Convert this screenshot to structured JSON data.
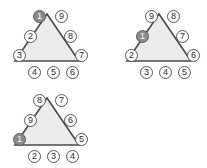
{
  "figure": {
    "background_color": "#ffffff",
    "triangle_fill_color": "#ececec",
    "triangle_stroke_color": "#4a4a4a",
    "node_fill_color": "#ffffff",
    "node_stroke_color": "#555555",
    "highlight_fill_color": "#8c8c8c",
    "highlight_text_color": "#ffffff",
    "node_count_per_triangle": 9,
    "triangle_count": 3
  },
  "chart_data": {
    "type": "diagram",
    "xlabel": "",
    "ylabel": "",
    "legend": [],
    "grid": false,
    "triangles": [
      {
        "id": "triangle-1",
        "position": "top-left",
        "highlighted_label": "1",
        "highlighted_slot": "apex-left",
        "labels_clockwise_from_apex_left": [
          "1",
          "9",
          "8",
          "7",
          "6",
          "5",
          "4",
          "3",
          "2"
        ],
        "nodes": [
          {
            "slot": "apex-left",
            "label": "1",
            "filled": true,
            "x": 33,
            "y": 10
          },
          {
            "slot": "apex-right",
            "label": "9",
            "filled": false,
            "x": 55,
            "y": 10
          },
          {
            "slot": "left-upper",
            "label": "2",
            "filled": false,
            "x": 24,
            "y": 30
          },
          {
            "slot": "right-upper",
            "label": "8",
            "filled": false,
            "x": 64,
            "y": 30
          },
          {
            "slot": "left-lower",
            "label": "3",
            "filled": false,
            "x": 13,
            "y": 49
          },
          {
            "slot": "right-lower",
            "label": "7",
            "filled": false,
            "x": 75,
            "y": 49
          },
          {
            "slot": "bottom-left",
            "label": "4",
            "filled": false,
            "x": 28,
            "y": 66
          },
          {
            "slot": "bottom-center",
            "label": "5",
            "filled": false,
            "x": 47,
            "y": 66
          },
          {
            "slot": "bottom-right",
            "label": "6",
            "filled": false,
            "x": 66,
            "y": 66
          }
        ]
      },
      {
        "id": "triangle-2",
        "position": "top-right",
        "highlighted_label": "1",
        "highlighted_slot": "left-upper",
        "labels_clockwise_from_apex_left": [
          "9",
          "8",
          "7",
          "6",
          "5",
          "4",
          "3",
          "2",
          "1"
        ],
        "nodes": [
          {
            "slot": "apex-left",
            "label": "9",
            "filled": false,
            "x": 33,
            "y": 10
          },
          {
            "slot": "apex-right",
            "label": "8",
            "filled": false,
            "x": 55,
            "y": 10
          },
          {
            "slot": "left-upper",
            "label": "1",
            "filled": true,
            "x": 24,
            "y": 30
          },
          {
            "slot": "right-upper",
            "label": "7",
            "filled": false,
            "x": 64,
            "y": 30
          },
          {
            "slot": "left-lower",
            "label": "2",
            "filled": false,
            "x": 13,
            "y": 49
          },
          {
            "slot": "right-lower",
            "label": "6",
            "filled": false,
            "x": 75,
            "y": 49
          },
          {
            "slot": "bottom-left",
            "label": "3",
            "filled": false,
            "x": 28,
            "y": 66
          },
          {
            "slot": "bottom-center",
            "label": "4",
            "filled": false,
            "x": 47,
            "y": 66
          },
          {
            "slot": "bottom-right",
            "label": "5",
            "filled": false,
            "x": 66,
            "y": 66
          }
        ]
      },
      {
        "id": "triangle-3",
        "position": "bottom-left",
        "highlighted_label": "1",
        "highlighted_slot": "left-lower",
        "labels_clockwise_from_apex_left": [
          "8",
          "7",
          "6",
          "5",
          "4",
          "3",
          "2",
          "1",
          "9"
        ],
        "nodes": [
          {
            "slot": "apex-left",
            "label": "8",
            "filled": false,
            "x": 33,
            "y": 10
          },
          {
            "slot": "apex-right",
            "label": "7",
            "filled": false,
            "x": 55,
            "y": 10
          },
          {
            "slot": "left-upper",
            "label": "9",
            "filled": false,
            "x": 24,
            "y": 30
          },
          {
            "slot": "right-upper",
            "label": "6",
            "filled": false,
            "x": 64,
            "y": 30
          },
          {
            "slot": "left-lower",
            "label": "1",
            "filled": true,
            "x": 13,
            "y": 49
          },
          {
            "slot": "right-lower",
            "label": "5",
            "filled": false,
            "x": 75,
            "y": 49
          },
          {
            "slot": "bottom-left",
            "label": "2",
            "filled": false,
            "x": 28,
            "y": 66
          },
          {
            "slot": "bottom-center",
            "label": "3",
            "filled": false,
            "x": 47,
            "y": 66
          },
          {
            "slot": "bottom-right",
            "label": "4",
            "filled": false,
            "x": 66,
            "y": 66
          }
        ]
      }
    ]
  }
}
